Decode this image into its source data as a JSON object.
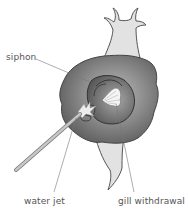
{
  "diagram": {
    "labels": {
      "siphon": "siphon",
      "water_jet": "water jet",
      "gill_withdrawal": "gill withdrawal"
    },
    "colors": {
      "mantle_outer": "#6e6e6e",
      "mantle_inner": "#9a9a9a",
      "body_light": "#e2e2e2",
      "outline": "#444444",
      "leader_line": "#777777",
      "text": "#555555"
    }
  }
}
